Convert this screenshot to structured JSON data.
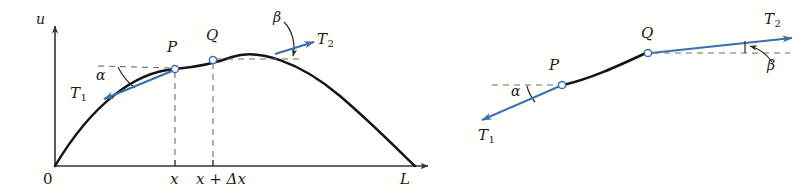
{
  "figure": {
    "background_color": "#fffffc",
    "curve_color": "#141414",
    "vector_color": "#3a6fb0",
    "dash_color": "#6d6d6d",
    "axis_color": "#333333"
  },
  "panels": [
    {
      "id": "left-panel",
      "name": "full-string-panel",
      "axes": {
        "vertical_axis_label": "u",
        "origin_label": "0",
        "x_tick_labels": [
          "x",
          "x + Δx"
        ],
        "right_end_label": "L"
      },
      "points": [
        {
          "label": "P",
          "x_label": "x"
        },
        {
          "label": "Q",
          "x_label": "x + Δx"
        }
      ],
      "vectors": [
        {
          "label": "T",
          "subscript": "1",
          "angle_label": "α",
          "at_point": "P",
          "direction": "down-left"
        },
        {
          "label": "T",
          "subscript": "2",
          "angle_label": "β",
          "at_point": "Q",
          "direction": "right"
        }
      ]
    },
    {
      "id": "right-panel",
      "name": "string-element-detail-panel",
      "points": [
        {
          "label": "P"
        },
        {
          "label": "Q"
        }
      ],
      "vectors": [
        {
          "label": "T",
          "subscript": "1",
          "angle_label": "α",
          "at_point": "P",
          "direction": "down-left"
        },
        {
          "label": "T",
          "subscript": "2",
          "angle_label": "β",
          "at_point": "Q",
          "direction": "up-right"
        }
      ]
    }
  ],
  "labels": {
    "u_axis": "u",
    "origin": "0",
    "x_tick": "x",
    "x_delta_tick": "x + Δx",
    "length_L": "L",
    "point_P_left": "P",
    "point_Q_left": "Q",
    "point_P_right": "P",
    "point_Q_right": "Q",
    "alpha_left": "α",
    "beta_left": "β",
    "alpha_right": "α",
    "beta_right": "β",
    "T_base": "T",
    "T1_sub": "1",
    "T2_sub": "2"
  }
}
